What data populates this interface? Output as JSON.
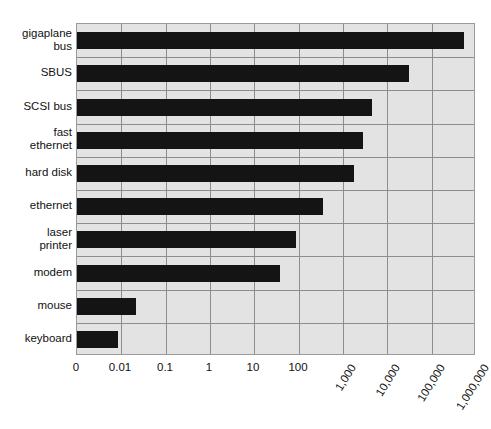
{
  "chart_data": {
    "type": "bar",
    "orientation": "horizontal",
    "title": "",
    "subtitle": "",
    "xlabel": "",
    "ylabel": "",
    "grid": true,
    "legend": null,
    "axis_scale": "piecewise-log (evenly spaced ticks)",
    "xtick_labels": [
      "0",
      "0.01",
      "0.1",
      "1",
      "10",
      "100",
      "1,000",
      "10,000",
      "100,000",
      "1,000,000"
    ],
    "xtick_values": [
      0,
      0.01,
      0.1,
      1,
      10,
      100,
      1000,
      10000,
      100000,
      1000000
    ],
    "xtick_rotated": [
      false,
      false,
      false,
      false,
      false,
      false,
      true,
      true,
      true,
      true
    ],
    "categories": [
      "gigaplane\nbus",
      "SBUS",
      "SCSI bus",
      "fast\nethernet",
      "hard disk",
      "ethernet",
      "laser\nprinter",
      "modem",
      "mouse",
      "keyboard"
    ],
    "values": [
      2500000,
      80000,
      9000,
      4000,
      2000,
      100,
      30,
      2,
      0.02,
      0.01
    ],
    "value_labels": [
      "2,500,000",
      "80,000",
      "9,000",
      "4,000",
      "2,000",
      "100",
      "30",
      "2",
      "0.02",
      "0.01"
    ],
    "bar_end_fraction": [
      0.97,
      0.832,
      0.739,
      0.717,
      0.693,
      0.617,
      0.549,
      0.51,
      0.147,
      0.103
    ],
    "colors": {
      "bar": "#141414",
      "plot_background": "#e3e3e3",
      "gridline": "#8d8d8d",
      "axis_border": "#9a9a9a",
      "text": "#111111",
      "page_background": "#ffffff"
    }
  }
}
